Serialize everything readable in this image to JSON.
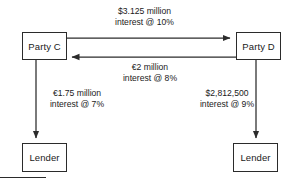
{
  "diagram": {
    "nodes": {
      "party_c": "Party C",
      "party_d": "Party D",
      "lender_left": "Lender",
      "lender_right": "Lender"
    },
    "edges": {
      "c_to_d": {
        "amount": "$3.125 million",
        "interest": "interest @ 10%",
        "direction": "right"
      },
      "d_to_c": {
        "amount": "€2 million",
        "interest": "interest @ 8%",
        "direction": "left"
      },
      "c_to_lender": {
        "amount": "€1.75 million",
        "interest": "interest @ 7%",
        "direction": "down"
      },
      "d_to_lender": {
        "amount": "$2,812,500",
        "interest": "interest @ 9%",
        "direction": "down"
      }
    },
    "colors": {
      "stroke": "#2b2b2b",
      "text": "#1a1a1a",
      "background": "#ffffff"
    }
  }
}
